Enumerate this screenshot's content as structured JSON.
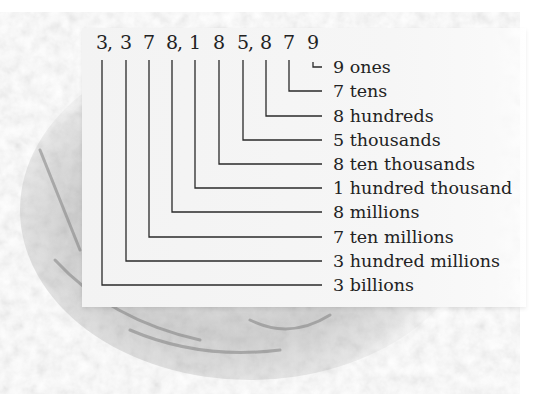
{
  "number": "3,378,185,879",
  "digits": [
    {
      "digit": "3",
      "comma": true,
      "x": 102,
      "place": "billions"
    },
    {
      "digit": "3",
      "comma": false,
      "x": 126,
      "place": "hundred millions"
    },
    {
      "digit": "7",
      "comma": false,
      "x": 149,
      "place": "ten millions"
    },
    {
      "digit": "8",
      "comma": true,
      "x": 172,
      "place": "millions"
    },
    {
      "digit": "1",
      "comma": false,
      "x": 195,
      "place": "hundred thousand"
    },
    {
      "digit": "8",
      "comma": false,
      "x": 219,
      "place": "ten thousands"
    },
    {
      "digit": "5",
      "comma": true,
      "x": 243,
      "place": "thousands"
    },
    {
      "digit": "8",
      "comma": false,
      "x": 266,
      "place": "hundreds"
    },
    {
      "digit": "7",
      "comma": false,
      "x": 289,
      "place": "tens"
    },
    {
      "digit": "9",
      "comma": false,
      "x": 313,
      "place": "ones"
    }
  ],
  "labels": [
    {
      "text": "9 ones",
      "y": 67
    },
    {
      "text": "7 tens",
      "y": 91
    },
    {
      "text": "8 hundreds",
      "y": 116
    },
    {
      "text": "5 thousands",
      "y": 140
    },
    {
      "text": "8 ten thousands",
      "y": 164
    },
    {
      "text": "1 hundred thousand",
      "y": 188
    },
    {
      "text": "8 millions",
      "y": 212
    },
    {
      "text": "7 ten millions",
      "y": 237
    },
    {
      "text": "3 hundred millions",
      "y": 261
    },
    {
      "text": "3 billions",
      "y": 285
    }
  ],
  "colors": {
    "line": "#2a2a2a",
    "text": "#222222",
    "panel": "#f4f4f4"
  }
}
